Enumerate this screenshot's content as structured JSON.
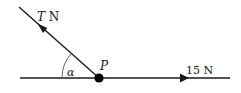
{
  "diagram": {
    "type": "force-diagram",
    "point": {
      "label": "P"
    },
    "angle": {
      "label": "α"
    },
    "forces": [
      {
        "id": "tension",
        "symbol": "T",
        "unit": "N",
        "direction": "up-left"
      },
      {
        "id": "horizontal",
        "magnitude": "15",
        "unit": "N",
        "direction": "right"
      }
    ],
    "labels": {
      "tension_symbol": "T",
      "tension_unit": " N",
      "horizontal_force": "15 N",
      "point": "P",
      "angle": "α"
    },
    "colors": {
      "line": "#1a1a1a",
      "point": "#000000",
      "arc": "#555555",
      "background": "#ffffff"
    }
  }
}
